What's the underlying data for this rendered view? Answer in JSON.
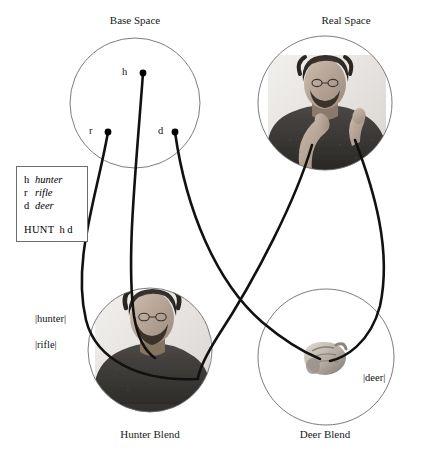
{
  "spaces": [
    {
      "id": "base",
      "label": "Base Space",
      "cx": 135,
      "cy": 103,
      "r": 65
    },
    {
      "id": "real",
      "label": "Real Space",
      "cx": 325,
      "cy": 103,
      "r": 67
    },
    {
      "id": "hunter_blend",
      "label": "Hunter Blend",
      "cx": 150,
      "cy": 350,
      "r": 62
    },
    {
      "id": "deer_blend",
      "label": "Deer Blend",
      "cx": 326,
      "cy": 357,
      "r": 68
    }
  ],
  "base_nodes": [
    {
      "id": "h",
      "label": "h",
      "x": 143,
      "y": 73
    },
    {
      "id": "r",
      "label": "r",
      "x": 108,
      "y": 132
    },
    {
      "id": "d",
      "label": "d",
      "x": 175,
      "y": 132
    }
  ],
  "legend": {
    "entries": [
      {
        "symbol": "h",
        "gloss": "hunter"
      },
      {
        "symbol": "r",
        "gloss": "rifle"
      },
      {
        "symbol": "d",
        "gloss": "deer"
      }
    ],
    "frame_name": "HUNT",
    "frame_args": "h d"
  },
  "frame_labels": [
    {
      "id": "hunter",
      "text": "|hunter|"
    },
    {
      "id": "rifle",
      "text": "|rifle|"
    },
    {
      "id": "deer",
      "text": "|deer|"
    }
  ],
  "images": [
    {
      "id": "real-space-photo",
      "alt": "signer with hand at chin, other hand raised",
      "space": "real"
    },
    {
      "id": "hunter-blend-photo",
      "alt": "signer torso portrait",
      "space": "hunter_blend"
    },
    {
      "id": "deer-blend-photo",
      "alt": "close-up of hand forming a sign",
      "space": "deer_blend"
    }
  ],
  "colors": {
    "circle_stroke": "#6d6d6d",
    "curve_stroke": "#111111",
    "node_fill": "#000000",
    "legend_border": "#6d6d6d",
    "text": "#111111",
    "background": "#ffffff"
  }
}
